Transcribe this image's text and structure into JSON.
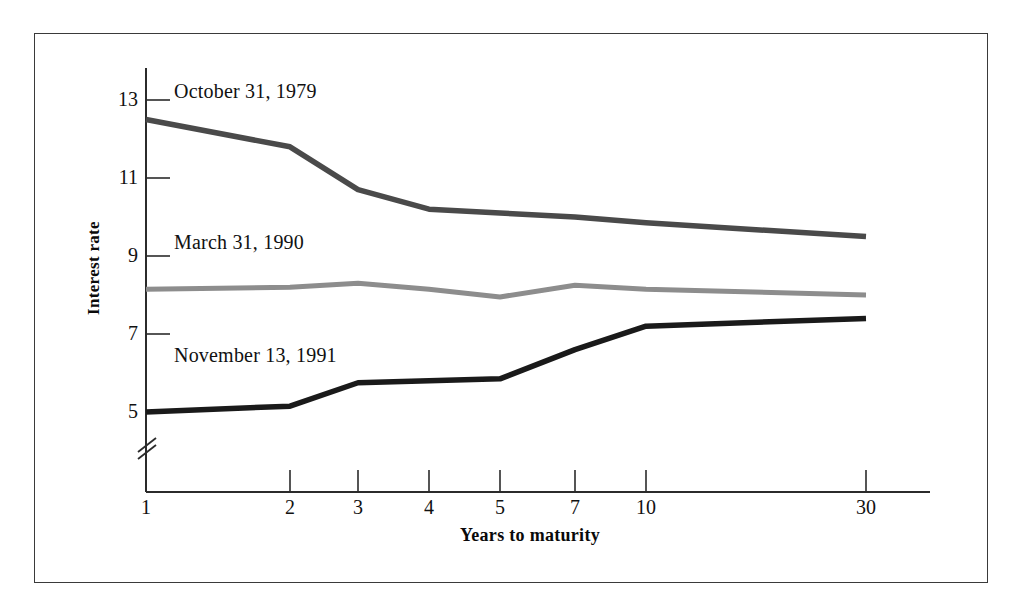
{
  "chart_data": {
    "type": "line",
    "title": "",
    "xlabel": "Years to maturity",
    "ylabel": "Interest rate",
    "categories": [
      "1",
      "2",
      "3",
      "4",
      "5",
      "7",
      "10",
      "30"
    ],
    "x_tick_labels": [
      "1",
      "2",
      "3",
      "4",
      "5",
      "7",
      "10",
      "30"
    ],
    "y_tick_labels": [
      "13",
      "11",
      "9",
      "7",
      "5"
    ],
    "y_ticks": [
      13,
      11,
      9,
      7,
      5
    ],
    "ylim": [
      4.4,
      13.6
    ],
    "y_axis_break": true,
    "grid": false,
    "legend_position": "inline-above-each-line",
    "series": [
      {
        "name": "October 31, 1979",
        "label": "October 31, 1979",
        "color": "#4a4a4a",
        "values": [
          12.5,
          11.8,
          10.7,
          10.2,
          10.1,
          10.0,
          9.85,
          9.5
        ]
      },
      {
        "name": "March 31, 1990",
        "label": "March 31, 1990",
        "color": "#8d8d8d",
        "values": [
          8.15,
          8.2,
          8.3,
          8.15,
          7.95,
          8.25,
          8.15,
          8.0
        ]
      },
      {
        "name": "November 13, 1991",
        "label": "November 13, 1991",
        "color": "#1a1a1a",
        "values": [
          5.0,
          5.15,
          5.75,
          5.8,
          5.85,
          6.6,
          7.2,
          7.4
        ]
      }
    ],
    "annotations": [
      "October 31, 1979",
      "March 31, 1990",
      "November 13, 1991"
    ]
  },
  "axes": {
    "y_title": "Interest rate",
    "x_title": "Years to maturity",
    "y_labels": [
      "13",
      "11",
      "9",
      "7",
      "5"
    ],
    "x_labels": [
      "1",
      "2",
      "3",
      "4",
      "5",
      "7",
      "10",
      "30"
    ]
  },
  "series_labels": {
    "s1979": "October 31, 1979",
    "s1990": "March 31, 1990",
    "s1991": "November 13, 1991"
  },
  "colors": {
    "line_1979": "#4a4a4a",
    "line_1990": "#8d8d8d",
    "line_1991": "#1a1a1a",
    "axis": "#2b2b2b",
    "frame": "#3a3a3a",
    "background": "#ffffff"
  }
}
